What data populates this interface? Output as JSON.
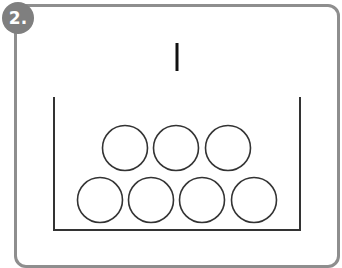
{
  "badge": {
    "label": "2."
  },
  "colors": {
    "frame": "#8e8e8e",
    "badge": "#7f7f7f",
    "stroke": "#333333"
  },
  "diagram": {
    "top_row_count": 3,
    "bottom_row_count": 4,
    "mark": "|"
  }
}
